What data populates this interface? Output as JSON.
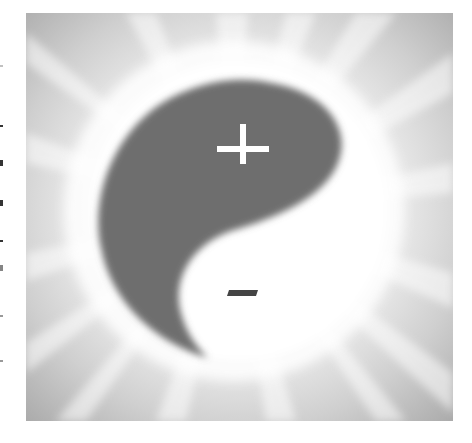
{
  "figure": {
    "symbols": {
      "dark_half_mark": "+",
      "light_half_mark": "−"
    },
    "colors": {
      "background_outer": "#b4b4b4",
      "glow": "#ffffff",
      "dark_half": "#6e6e6e",
      "light_half": "#ffffff",
      "plus_mark": "#ffffff",
      "minus_mark": "#444444"
    }
  }
}
